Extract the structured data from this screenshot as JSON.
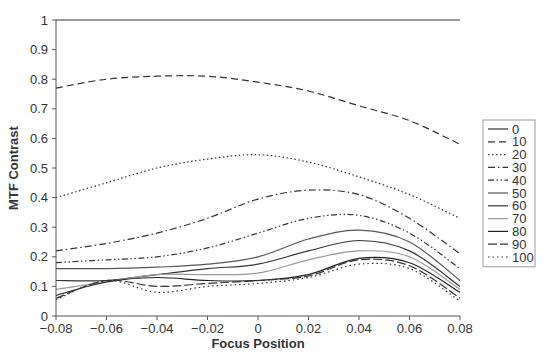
{
  "chart_data": {
    "type": "line",
    "title": "",
    "xlabel": "Focus Position",
    "ylabel": "MTF Contrast",
    "xlim": [
      -0.08,
      0.08
    ],
    "ylim": [
      0,
      1
    ],
    "grid": false,
    "legend_position": "right",
    "x_ticks": [
      "-0.08",
      "-0.06",
      "-0.04",
      "-0.02",
      "0",
      "0.02",
      "0.04",
      "0.06",
      "0.08"
    ],
    "y_ticks": [
      "0",
      "0.1",
      "0.2",
      "0.3",
      "0.4",
      "0.5",
      "0.6",
      "0.7",
      "0.8",
      "0.9",
      "1"
    ],
    "x": [
      -0.08,
      -0.06,
      -0.04,
      -0.02,
      0,
      0.02,
      0.04,
      0.06,
      0.08
    ],
    "series": [
      {
        "name": "0",
        "style": "solid",
        "color": "#333333",
        "values": [
          1.0,
          1.0,
          1.0,
          1.0,
          1.0,
          1.0,
          1.0,
          1.0,
          1.0
        ]
      },
      {
        "name": "10",
        "style": "dashed",
        "color": "#333333",
        "values": [
          0.77,
          0.8,
          0.81,
          0.81,
          0.79,
          0.76,
          0.71,
          0.66,
          0.58
        ]
      },
      {
        "name": "20",
        "style": "dotted",
        "color": "#333333",
        "values": [
          0.4,
          0.45,
          0.5,
          0.53,
          0.545,
          0.52,
          0.47,
          0.41,
          0.33
        ]
      },
      {
        "name": "30",
        "style": "dash-dot",
        "color": "#333333",
        "values": [
          0.22,
          0.245,
          0.28,
          0.33,
          0.395,
          0.425,
          0.41,
          0.33,
          0.21
        ]
      },
      {
        "name": "40",
        "style": "dash-dot-dot",
        "color": "#333333",
        "values": [
          0.18,
          0.19,
          0.2,
          0.23,
          0.28,
          0.33,
          0.34,
          0.28,
          0.16
        ]
      },
      {
        "name": "50",
        "style": "solid",
        "color": "#555555",
        "values": [
          0.16,
          0.16,
          0.165,
          0.175,
          0.2,
          0.26,
          0.29,
          0.25,
          0.12
        ]
      },
      {
        "name": "60",
        "style": "solid",
        "color": "#333333",
        "values": [
          0.12,
          0.12,
          0.14,
          0.16,
          0.175,
          0.22,
          0.255,
          0.22,
          0.1
        ]
      },
      {
        "name": "70",
        "style": "solid",
        "color": "#999999",
        "values": [
          0.09,
          0.115,
          0.14,
          0.14,
          0.145,
          0.19,
          0.22,
          0.2,
          0.09
        ]
      },
      {
        "name": "80",
        "style": "solid",
        "color": "#222222",
        "values": [
          0.07,
          0.115,
          0.13,
          0.12,
          0.12,
          0.14,
          0.195,
          0.18,
          0.08
        ]
      },
      {
        "name": "90",
        "style": "long-dash",
        "color": "#333333",
        "values": [
          0.06,
          0.12,
          0.1,
          0.11,
          0.12,
          0.135,
          0.19,
          0.17,
          0.06
        ]
      },
      {
        "name": "100",
        "style": "sparse-dot",
        "color": "#333333",
        "values": [
          0.055,
          0.12,
          0.08,
          0.1,
          0.11,
          0.13,
          0.175,
          0.16,
          0.05
        ]
      }
    ]
  },
  "axes": {
    "xlabel": "Focus Position",
    "ylabel": "MTF Contrast"
  },
  "legend": {
    "entries": [
      "0",
      "10",
      "20",
      "30",
      "40",
      "50",
      "60",
      "70",
      "80",
      "90",
      "100"
    ]
  }
}
